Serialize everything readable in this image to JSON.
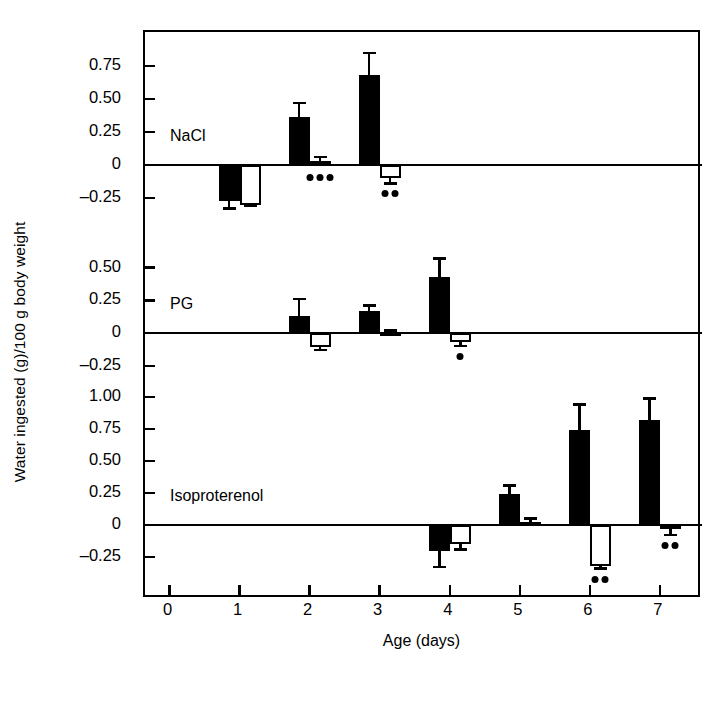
{
  "chart_data": {
    "type": "bar",
    "title": "",
    "xlabel": "Age (days)",
    "ylabel": "Water ingested (g)/100 g body weight",
    "grid": false,
    "legend": "none",
    "x": [
      0,
      1,
      2,
      3,
      4,
      5,
      6,
      7
    ],
    "xtick_labels": [
      "0",
      "1",
      "2",
      "3",
      "4",
      "5",
      "6",
      "7"
    ],
    "xlim": [
      -0.35,
      7.6
    ],
    "panels": [
      {
        "name": "NaCl",
        "label": "NaCl",
        "ylim": [
          -0.45,
          0.95
        ],
        "ytick_values": [
          0.75,
          0.5,
          0.25,
          0,
          -0.25
        ],
        "ytick_labels": [
          "0.75",
          "0.50",
          "0.25",
          "0",
          "–0.25"
        ],
        "series": [
          {
            "name": "filled",
            "style": "solid-black",
            "points": [
              {
                "x": 1,
                "value": -0.27,
                "err": 0.06
              },
              {
                "x": 2,
                "value": 0.36,
                "err": 0.11
              },
              {
                "x": 3,
                "value": 0.68,
                "err": 0.17
              }
            ]
          },
          {
            "name": "open",
            "style": "open-white",
            "points": [
              {
                "x": 1,
                "value": -0.3,
                "err": 0.01
              },
              {
                "x": 2,
                "value": 0.03,
                "err": 0.03
              },
              {
                "x": 3,
                "value": -0.1,
                "err": 0.04
              }
            ]
          }
        ],
        "significance": [
          {
            "x": 2,
            "series": "open",
            "marks": 3,
            "below": true
          },
          {
            "x": 3,
            "series": "open",
            "marks": 2,
            "below": true
          }
        ]
      },
      {
        "name": "PG",
        "label": "PG",
        "ylim": [
          -0.3,
          0.62
        ],
        "ytick_values": [
          0.5,
          0.25,
          0,
          -0.25
        ],
        "ytick_labels": [
          "0.50",
          "0.25",
          "0",
          "–0.25"
        ],
        "series": [
          {
            "name": "filled",
            "style": "solid-black",
            "points": [
              {
                "x": 2,
                "value": 0.13,
                "err": 0.13
              },
              {
                "x": 3,
                "value": 0.17,
                "err": 0.04
              },
              {
                "x": 4,
                "value": 0.43,
                "err": 0.14
              }
            ]
          },
          {
            "name": "open",
            "style": "open-white",
            "points": [
              {
                "x": 2,
                "value": -0.11,
                "err": 0.02
              },
              {
                "x": 3,
                "value": 0.01,
                "err": 0.01
              },
              {
                "x": 4,
                "value": -0.07,
                "err": 0.03
              }
            ]
          }
        ],
        "significance": [
          {
            "x": 4,
            "series": "open",
            "marks": 1,
            "below": true
          }
        ]
      },
      {
        "name": "Isoproterenol",
        "label": "Isoproterenol",
        "ylim": [
          -0.42,
          1.15
        ],
        "ytick_values": [
          1.0,
          0.75,
          0.5,
          0.25,
          0,
          -0.25
        ],
        "ytick_labels": [
          "1.00",
          "0.75",
          "0.50",
          "0.25",
          "0",
          "–0.25"
        ],
        "series": [
          {
            "name": "filled",
            "style": "solid-black",
            "points": [
              {
                "x": 4,
                "value": -0.2,
                "err": 0.13
              },
              {
                "x": 5,
                "value": 0.24,
                "err": 0.07
              },
              {
                "x": 6,
                "value": 0.74,
                "err": 0.2
              },
              {
                "x": 7,
                "value": 0.82,
                "err": 0.17
              }
            ]
          },
          {
            "name": "open",
            "style": "open-white",
            "points": [
              {
                "x": 4,
                "value": -0.15,
                "err": 0.04
              },
              {
                "x": 5,
                "value": 0.02,
                "err": 0.03
              },
              {
                "x": 6,
                "value": -0.32,
                "err": 0.02
              },
              {
                "x": 7,
                "value": -0.03,
                "err": 0.05
              }
            ]
          }
        ],
        "significance": [
          {
            "x": 6,
            "series": "open",
            "marks": 2,
            "below": true
          },
          {
            "x": 7,
            "series": "open",
            "marks": 2,
            "below": true
          }
        ]
      }
    ]
  },
  "colors": {
    "axis": "#000000",
    "filled_bar": "#000000",
    "open_bar": "#ffffff",
    "background": "#ffffff"
  }
}
